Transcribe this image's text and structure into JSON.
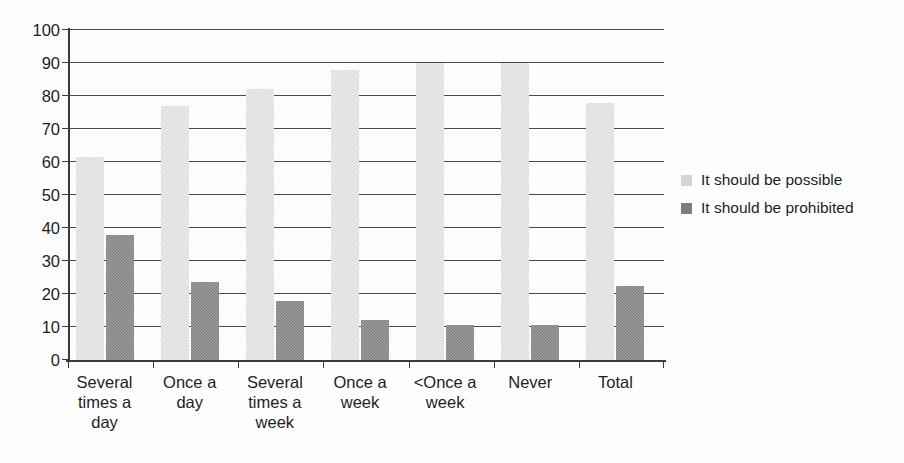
{
  "chart_data": {
    "type": "bar",
    "title": "",
    "subtitle": "",
    "xlabel": "",
    "ylabel": "",
    "ylim": [
      0,
      100
    ],
    "ytick_step": 10,
    "yticks": [
      100,
      90,
      80,
      70,
      60,
      50,
      40,
      30,
      20,
      10,
      0
    ],
    "ytick_labels": [
      "100",
      "90",
      "80",
      "70",
      "60",
      "50",
      "40",
      "30",
      "20",
      "10",
      "0"
    ],
    "grid": true,
    "grid_axis": "y",
    "legend_position": "right",
    "categories": [
      "Several times a day",
      "Once a day",
      "Several times a week",
      "Once a week",
      "<Once a week",
      "Never",
      "Total"
    ],
    "category_labels_wrapped": [
      "Several\ntimes a\nday",
      "Once a\nday",
      "Several\ntimes a\nweek",
      "Once a\nweek",
      "<Once a\nweek",
      "Never",
      "Total"
    ],
    "series": [
      {
        "name": "It should be possible",
        "color": "#d4d4d4",
        "values": [
          61.5,
          77,
          82,
          88,
          90,
          90,
          78
        ]
      },
      {
        "name": "It should be prohibited",
        "color": "#7d7d7d",
        "values": [
          38,
          23.5,
          18,
          12,
          10.5,
          10.5,
          22.5
        ]
      }
    ],
    "annotations": []
  },
  "legend": {
    "items": [
      {
        "label": "It should be possible",
        "swatch": "possible"
      },
      {
        "label": "It should be prohibited",
        "swatch": "prohibited"
      }
    ]
  },
  "axis": {
    "y_labels": [
      "100",
      "90",
      "80",
      "70",
      "60",
      "50",
      "40",
      "30",
      "20",
      "10",
      "0"
    ]
  }
}
